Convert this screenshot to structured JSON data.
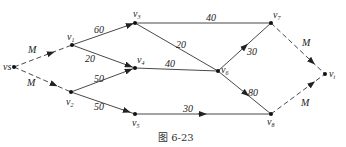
{
  "caption": "图 6-23",
  "nodes": [
    {
      "id": "vs",
      "label": "vs",
      "sub": "s",
      "x": 14,
      "y": 67
    },
    {
      "id": "v1",
      "label": "v",
      "sub": "1",
      "x": 72,
      "y": 45
    },
    {
      "id": "v2",
      "label": "v",
      "sub": "2",
      "x": 71,
      "y": 92
    },
    {
      "id": "v3",
      "label": "v",
      "sub": "3",
      "x": 135,
      "y": 23
    },
    {
      "id": "v4",
      "label": "v",
      "sub": "4",
      "x": 135,
      "y": 68
    },
    {
      "id": "v5",
      "label": "v",
      "sub": "5",
      "x": 135,
      "y": 114
    },
    {
      "id": "v6",
      "label": "v",
      "sub": "6",
      "x": 218,
      "y": 71
    },
    {
      "id": "v7",
      "label": "v",
      "sub": "7",
      "x": 271,
      "y": 23
    },
    {
      "id": "v8",
      "label": "v",
      "sub": "8",
      "x": 271,
      "y": 114
    },
    {
      "id": "vt",
      "label": "v",
      "sub": "t",
      "x": 325,
      "y": 74
    }
  ],
  "edges": [
    {
      "from": "vs",
      "to": "v1",
      "weight": "M",
      "dashed": true
    },
    {
      "from": "vs",
      "to": "v2",
      "weight": "M",
      "dashed": true
    },
    {
      "from": "v1",
      "to": "v3",
      "weight": "60",
      "dashed": false
    },
    {
      "from": "v1",
      "to": "v4",
      "weight": "20",
      "dashed": false
    },
    {
      "from": "v2",
      "to": "v4",
      "weight": "50",
      "dashed": false
    },
    {
      "from": "v2",
      "to": "v5",
      "weight": "50",
      "dashed": false
    },
    {
      "from": "v3",
      "to": "v7",
      "weight": "40",
      "dashed": false
    },
    {
      "from": "v3",
      "to": "v6",
      "weight": "20",
      "dashed": false
    },
    {
      "from": "v4",
      "to": "v6",
      "weight": "40",
      "dashed": false
    },
    {
      "from": "v6",
      "to": "v7",
      "weight": "30",
      "dashed": false
    },
    {
      "from": "v6",
      "to": "v8",
      "weight": "80",
      "dashed": false
    },
    {
      "from": "v5",
      "to": "v8",
      "weight": "30",
      "dashed": false
    },
    {
      "from": "v7",
      "to": "vt",
      "weight": "M",
      "dashed": true
    },
    {
      "from": "v8",
      "to": "vt",
      "weight": "M",
      "dashed": true
    }
  ]
}
